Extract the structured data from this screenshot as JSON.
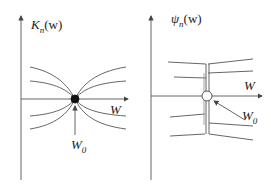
{
  "left_panel": {
    "y_label": "K",
    "y_label_sub": "n",
    "y_label_arg": "(w)",
    "x_label": "W",
    "point_label": "W",
    "point_label_sub": "0",
    "point_style": "filled"
  },
  "right_panel": {
    "y_label": "ψ",
    "y_label_sub": "n",
    "y_label_arg": "(w)",
    "x_label": "W",
    "point_label": "W",
    "point_label_sub": "0",
    "point_style": "hollow"
  },
  "colors": {
    "line": "#555555",
    "text": "#222222",
    "background": "#ffffff"
  }
}
